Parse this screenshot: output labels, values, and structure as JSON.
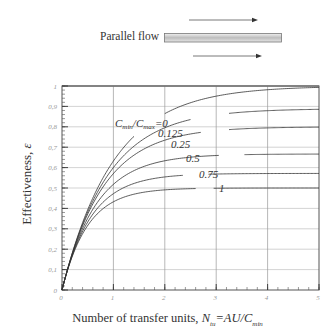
{
  "header": {
    "label": "Parallel flow",
    "diagram": "tube with two same-direction arrows"
  },
  "chart_data": {
    "type": "line",
    "title": "",
    "xlabel": "Number of transfer units, N_tu=AU/C_min",
    "ylabel": "Effectiveness, ε",
    "xlim": [
      0,
      5
    ],
    "ylim": [
      0,
      1
    ],
    "x_ticks": [
      0,
      1,
      2,
      3,
      4,
      5
    ],
    "y_ticks": [
      0,
      0.1,
      0.2,
      0.3,
      0.4,
      0.5,
      0.6,
      0.7,
      0.8,
      0.9,
      1
    ],
    "x_tick_labels": [
      "0",
      "1",
      "2",
      "3",
      "4",
      "5"
    ],
    "y_tick_labels": [
      "0",
      "0,1",
      "0,2",
      "0,3",
      "0,4",
      "0,5",
      "0,6",
      "0,7",
      "0,8",
      "0,9",
      "1"
    ],
    "grid": true,
    "legend": "inline curve labels",
    "x": [
      0,
      0.25,
      0.5,
      0.75,
      1,
      1.25,
      1.5,
      2,
      2.5,
      3,
      3.5,
      4,
      4.5,
      5
    ],
    "series": [
      {
        "name": "Cmin/Cmax=0",
        "label": "C_min/C_max=0",
        "C": 0,
        "values": [
          0,
          0.221,
          0.393,
          0.528,
          0.632,
          0.713,
          0.777,
          0.865,
          0.918,
          0.95,
          0.97,
          0.982,
          0.989,
          0.993
        ]
      },
      {
        "name": "0.125",
        "label": "0.125",
        "C": 0.125,
        "values": [
          0,
          0.216,
          0.38,
          0.505,
          0.6,
          0.671,
          0.725,
          0.796,
          0.834,
          0.856,
          0.868,
          0.875,
          0.879,
          0.885
        ]
      },
      {
        "name": "0.25",
        "label": "0.25",
        "C": 0.25,
        "values": [
          0,
          0.214,
          0.371,
          0.486,
          0.571,
          0.633,
          0.679,
          0.735,
          0.766,
          0.781,
          0.79,
          0.795,
          0.797,
          0.798
        ]
      },
      {
        "name": "0.5",
        "label": "0.5",
        "C": 0.5,
        "values": [
          0,
          0.209,
          0.351,
          0.45,
          0.518,
          0.565,
          0.596,
          0.635,
          0.652,
          0.659,
          0.663,
          0.665,
          0.666,
          0.667
        ]
      },
      {
        "name": "0.75",
        "label": "0.75",
        "C": 0.75,
        "values": [
          0,
          0.204,
          0.333,
          0.418,
          0.472,
          0.507,
          0.53,
          0.554,
          0.565,
          0.569,
          0.57,
          0.571,
          0.571,
          0.571
        ]
      },
      {
        "name": "1",
        "label": "1",
        "C": 1,
        "values": [
          0,
          0.197,
          0.316,
          0.389,
          0.432,
          0.459,
          0.475,
          0.491,
          0.497,
          0.499,
          0.5,
          0.5,
          0.5,
          0.5
        ]
      }
    ]
  },
  "labels": {
    "x_title_main": "Number of transfer units, ",
    "x_title_N": "N",
    "x_title_tu": "tu",
    "x_title_mid": "=AU/C",
    "x_title_min": "min",
    "y_title_main": "Effectiveness, ",
    "y_title_eps": "ε",
    "c0_C1": "C",
    "c0_min": "min",
    "c0_slash": "/C",
    "c0_max": "max",
    "c0_eq": "=0"
  }
}
